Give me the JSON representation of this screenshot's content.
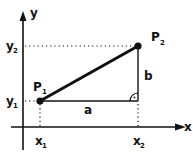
{
  "diagram": {
    "axes": {
      "x_label": "x",
      "y_label": "y"
    },
    "points": [
      {
        "name": "P",
        "subscript": "1",
        "x_px": 40,
        "y_px": 101
      },
      {
        "name": "P",
        "subscript": "2",
        "x_px": 138,
        "y_px": 46
      }
    ],
    "tick_labels": {
      "x1": {
        "base": "x",
        "sub": "1"
      },
      "x2": {
        "base": "x",
        "sub": "2"
      },
      "y1": {
        "base": "y",
        "sub": "1"
      },
      "y2": {
        "base": "y",
        "sub": "2"
      }
    },
    "segments": {
      "horizontal_leg": "a",
      "vertical_leg": "b"
    },
    "right_angle_marker": "right-angle",
    "colors": {
      "ink": "#111111",
      "background": "#ffffff"
    }
  }
}
